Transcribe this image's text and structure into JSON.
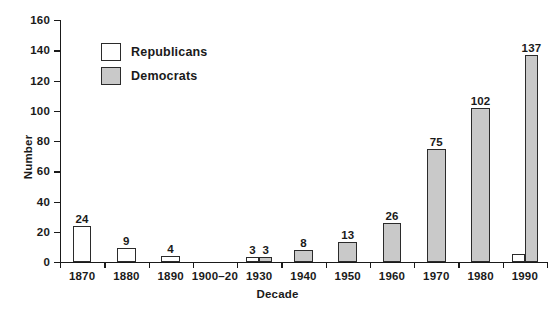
{
  "chart_data": {
    "type": "bar",
    "title": "",
    "xlabel": "Decade",
    "ylabel": "Number",
    "ylim": [
      0,
      160
    ],
    "yticks": [
      0,
      20,
      40,
      60,
      80,
      100,
      120,
      140,
      160
    ],
    "grid": false,
    "legend_position": "upper-left-inside",
    "categories": [
      "1870",
      "1880",
      "1890",
      "1900–20",
      "1930",
      "1940",
      "1950",
      "1960",
      "1970",
      "1980",
      "1990"
    ],
    "series": [
      {
        "name": "Republicans",
        "color": "#ffffff",
        "values": [
          24,
          9,
          4,
          0,
          3,
          0,
          0,
          0,
          0,
          0,
          5
        ],
        "labels": [
          "24",
          "9",
          "4",
          "",
          "3",
          "",
          "",
          "",
          "",
          "",
          ""
        ]
      },
      {
        "name": "Democrats",
        "color": "#c9c9c9",
        "values": [
          0,
          0,
          0,
          0,
          3,
          8,
          13,
          26,
          75,
          102,
          137
        ],
        "labels": [
          "",
          "",
          "",
          "",
          "3",
          "8",
          "13",
          "26",
          "75",
          "102",
          "137"
        ]
      }
    ]
  },
  "axes": {
    "y_title": "Number",
    "x_title": "Decade",
    "y_tick_labels": [
      "0",
      "20",
      "40",
      "60",
      "80",
      "100",
      "120",
      "140",
      "160"
    ],
    "x_tick_labels": [
      "1870",
      "1880",
      "1890",
      "1900–20",
      "1930",
      "1940",
      "1950",
      "1960",
      "1970",
      "1980",
      "1990"
    ]
  },
  "legend": {
    "items": [
      {
        "label": "Republicans",
        "swatch": "republicans-swatch"
      },
      {
        "label": "Democrats",
        "swatch": "democrats-swatch"
      }
    ]
  },
  "colors": {
    "republican_fill": "#ffffff",
    "democrat_fill": "#c9c9c9",
    "outline": "#2b2b2b",
    "axis": "#1a1a1a",
    "background": "#ffffff"
  }
}
